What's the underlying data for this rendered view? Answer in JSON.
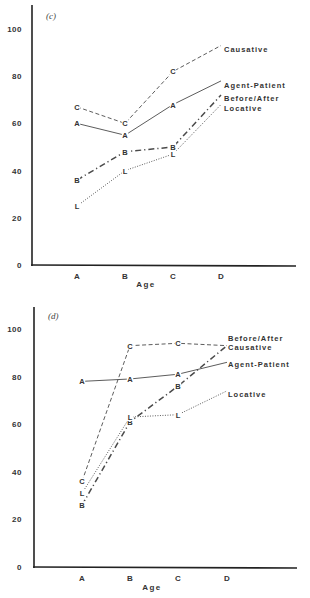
{
  "chart_data": [
    {
      "type": "line",
      "panel": "(c)",
      "title": "(c)",
      "xlabel": "Age",
      "ylabel": "",
      "categories": [
        "A",
        "B",
        "C",
        "D"
      ],
      "yticks": [
        0,
        20,
        40,
        60,
        80,
        100
      ],
      "ylim": [
        0,
        110
      ],
      "grid": false,
      "legend_position": "inline-right-end",
      "series": [
        {
          "name": "Causative",
          "marker": "C",
          "style": "dashed",
          "values": [
            67,
            60,
            82,
            93
          ]
        },
        {
          "name": "Agent-Patient",
          "marker": "A",
          "style": "solid",
          "values": [
            60,
            55,
            68,
            78
          ]
        },
        {
          "name": "Before/After",
          "marker": "B",
          "style": "dash-dot",
          "values": [
            36,
            48,
            50,
            72
          ]
        },
        {
          "name": "Locative",
          "marker": "L",
          "style": "dotted",
          "values": [
            25,
            40,
            47,
            68
          ]
        }
      ]
    },
    {
      "type": "line",
      "panel": "(d)",
      "title": "(d)",
      "xlabel": "Age",
      "ylabel": "",
      "categories": [
        "A",
        "B",
        "C",
        "D"
      ],
      "yticks": [
        0,
        20,
        40,
        60,
        80,
        100
      ],
      "ylim": [
        0,
        110
      ],
      "grid": false,
      "legend_position": "inline-right-end",
      "series": [
        {
          "name": "Causative",
          "marker": "C",
          "style": "dashed",
          "values": [
            36,
            93,
            94,
            93
          ]
        },
        {
          "name": "Agent-Patient",
          "marker": "A",
          "style": "solid",
          "values": [
            78,
            79,
            81,
            86
          ]
        },
        {
          "name": "Before/After",
          "marker": "B",
          "style": "dash-dot",
          "values": [
            26,
            61,
            76,
            93
          ]
        },
        {
          "name": "Locative",
          "marker": "L",
          "style": "dotted",
          "values": [
            31,
            63,
            64,
            74
          ]
        }
      ]
    }
  ],
  "panels": [
    {
      "label": "(c)",
      "xlabel": "Age",
      "layout": {
        "x0": 32,
        "y0": 265,
        "ytop": 5,
        "xend": 296,
        "pxPerUnit": 2.36,
        "xpos": [
          77,
          125,
          173,
          221
        ],
        "tickLabelX": 22,
        "panelLabelX": 46,
        "panelLabelY": 19,
        "agePos": [
          146,
          287
        ],
        "labelY": {
          "Causative": 49,
          "Agent-Patient": 85,
          "Before/After": 98,
          "Locative": 108
        }
      },
      "labelX": 224
    },
    {
      "label": "(d)",
      "xlabel": "Age",
      "layout": {
        "x0": 34,
        "y0": 567,
        "ytop": 307,
        "xend": 297,
        "pxPerUnit": 2.38,
        "xpos": [
          82,
          130,
          178,
          227
        ],
        "tickLabelX": 22,
        "panelLabelX": 48,
        "panelLabelY": 319,
        "agePos": [
          152,
          590
        ],
        "labelY": {
          "Causative": 347,
          "Agent-Patient": 364,
          "Before/After": 338,
          "Locative": 394
        }
      },
      "labelX": 228
    }
  ],
  "styles": {
    "dashed": "4,2.5",
    "solid": "",
    "dash-dot": "6,3,1.2,3",
    "dotted": "1,1.5",
    "line_color": "#4a4a4a",
    "axis_color": "#222222"
  }
}
